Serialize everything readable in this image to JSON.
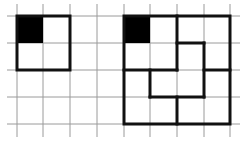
{
  "diagram": {
    "type": "grid-tiling-puzzle",
    "grid": {
      "x_lines": [
        17,
        43,
        70,
        97,
        124,
        150,
        177,
        204,
        230
      ],
      "y_lines": [
        16,
        43,
        70,
        97,
        124
      ],
      "x_extent": [
        7,
        240
      ],
      "y_extent": [
        4,
        137
      ],
      "color": "#9a9a9a"
    },
    "figures": [
      {
        "name": "small-square",
        "outline": [
          [
            17,
            16
          ],
          [
            70,
            16
          ],
          [
            70,
            70
          ],
          [
            17,
            70
          ]
        ],
        "filled_cell": [
          17,
          16,
          26,
          27
        ],
        "inner_segments": []
      },
      {
        "name": "large-square-partitioned",
        "outline": [
          [
            124,
            16
          ],
          [
            230,
            16
          ],
          [
            230,
            124
          ],
          [
            124,
            124
          ]
        ],
        "filled_cell": [
          124,
          16,
          26,
          27
        ],
        "inner_segments": [
          [
            177,
            16,
            177,
            70
          ],
          [
            177,
            43,
            204,
            43
          ],
          [
            204,
            43,
            204,
            97
          ],
          [
            124,
            70,
            177,
            70
          ],
          [
            204,
            70,
            230,
            70
          ],
          [
            150,
            70,
            150,
            97
          ],
          [
            150,
            97,
            204,
            97
          ],
          [
            177,
            97,
            177,
            124
          ]
        ]
      }
    ],
    "colors": {
      "outline": "#111111",
      "fill": "#000000",
      "background": "#ffffff"
    }
  }
}
